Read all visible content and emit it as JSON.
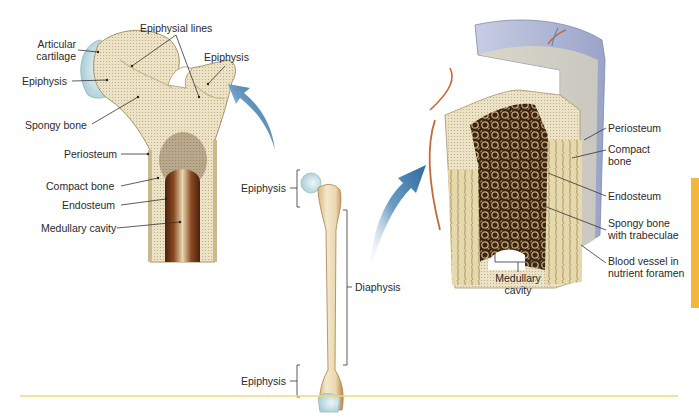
{
  "figure": {
    "panels": {
      "left": {
        "name": "Proximal femur longitudinal section",
        "labels": {
          "articular_cartilage": "Articular\ncartilage",
          "articular_line1": "Articular",
          "articular_line2": "cartilage",
          "epiphysial_lines": "Epiphysial lines",
          "epiphysis_left": "Epiphysis",
          "epiphysis_right": "Epiphysis",
          "spongy_bone": "Spongy bone",
          "periosteum": "Periosteum",
          "compact_bone": "Compact bone",
          "endosteum": "Endosteum",
          "medullary_cavity": "Medullary cavity"
        }
      },
      "center": {
        "name": "Whole femur",
        "labels": {
          "epiphysis_top": "Epiphysis",
          "diaphysis": "Diaphysis",
          "epiphysis_bottom": "Epiphysis"
        }
      },
      "right": {
        "name": "Diaphysis wall section",
        "labels": {
          "periosteum": "Periosteum",
          "compact_line1": "Compact",
          "compact_line2": "bone",
          "endosteum": "Endosteum",
          "spongy_line1": "Spongy bone",
          "spongy_line2": "with trabeculae",
          "blood_line1": "Blood vessel in",
          "blood_line2": "nutrient foramen",
          "medullary_line1": "Medullary",
          "medullary_line2": "cavity"
        }
      }
    },
    "colors": {
      "bone": "#efe6cc",
      "bone_shade": "#d9c79c",
      "cartilage": "#cfe3e8",
      "marrow_dark": "#5a2d16",
      "arrow": "#3f7aa8",
      "divider": "#f0d77a",
      "side_tab": "#f3b73b",
      "label_text": "#2a2a2a",
      "leader": "#333333"
    }
  }
}
